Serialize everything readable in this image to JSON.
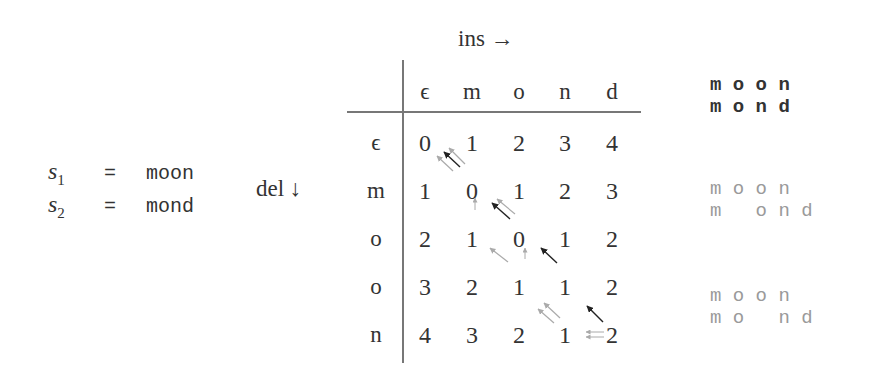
{
  "definitions": [
    {
      "var": "s",
      "sub": "1",
      "eq": "=",
      "value": "moon"
    },
    {
      "var": "s",
      "sub": "2",
      "eq": "=",
      "value": "mond"
    }
  ],
  "axes": {
    "insert_label": "ins →",
    "delete_label": "del ↓"
  },
  "table": {
    "col_headers": [
      "ϵ",
      "m",
      "o",
      "n",
      "d"
    ],
    "row_headers": [
      "ϵ",
      "m",
      "o",
      "o",
      "n"
    ],
    "cells": [
      [
        "0",
        "1",
        "2",
        "3",
        "4"
      ],
      [
        "1",
        "0",
        "1",
        "2",
        "3"
      ],
      [
        "2",
        "1",
        "0",
        "1",
        "2"
      ],
      [
        "3",
        "2",
        "1",
        "1",
        "2"
      ],
      [
        "4",
        "3",
        "2",
        "1",
        "2"
      ]
    ]
  },
  "alignments": [
    {
      "top": "m o o n",
      "bottom": "m o n d",
      "style": "primary"
    },
    {
      "top": "m o o n",
      "bottom": "m   o n d",
      "style": "secondary"
    },
    {
      "top": "m o o n",
      "bottom": "m o   n d",
      "style": "secondary"
    }
  ],
  "colors": {
    "text": "#333333",
    "arrow_primary": "#222222",
    "arrow_secondary": "#a8a8a8",
    "rule": "#777777",
    "alignment_secondary": "#9a9a9a"
  }
}
